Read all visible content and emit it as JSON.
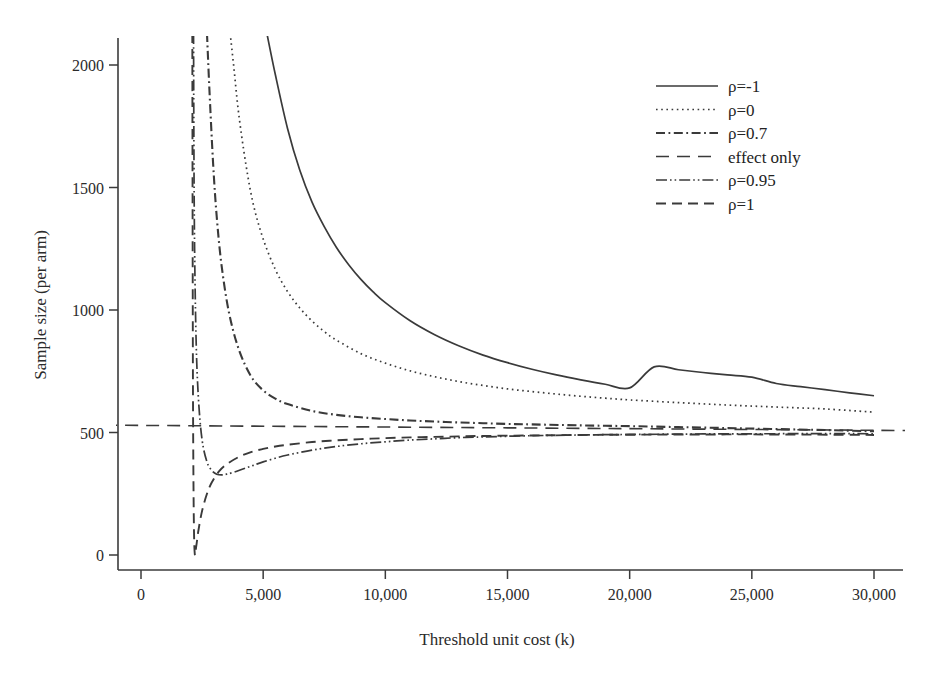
{
  "chart_data": {
    "type": "line",
    "title": "",
    "xlabel": "Threshold unit cost (k)",
    "ylabel": "Sample size (per arm)",
    "xlim": [
      -1500,
      31500
    ],
    "ylim": [
      -130,
      2130
    ],
    "xticks": [
      0,
      5000,
      10000,
      15000,
      20000,
      25000,
      30000
    ],
    "xticklabels": [
      "0",
      "5,000",
      "10,000",
      "15,000",
      "20,000",
      "25,000",
      "30,000"
    ],
    "yticks": [
      0,
      500,
      1000,
      1500,
      2000
    ],
    "yticklabels": [
      "0",
      "500",
      "1000",
      "1500",
      "2000"
    ],
    "grid": false,
    "legend_position": "upper right",
    "line_color": "#3a3a3a",
    "series": [
      {
        "name": "ρ=−1",
        "legend_label": "ρ=-1",
        "dash": "solid",
        "width": 1.7,
        "x": [
          5150,
          5500,
          6000,
          6500,
          7000,
          7500,
          8000,
          8500,
          9000,
          9500,
          10000,
          11000,
          12000,
          13000,
          14000,
          15000,
          16000,
          17000,
          18000,
          19000,
          20000,
          21000,
          22000,
          23000,
          24000,
          25000,
          26000,
          27000,
          28000,
          29000,
          30000
        ],
        "y": [
          2130,
          1960,
          1740,
          1570,
          1440,
          1340,
          1255,
          1185,
          1125,
          1074,
          1030,
          957,
          900,
          854,
          816,
          785,
          758,
          735,
          715,
          697,
          682,
          768,
          756,
          745,
          735,
          726,
          700,
          687,
          675,
          662,
          650
        ]
      },
      {
        "name": "ρ=0",
        "legend_label": "ρ=0",
        "dash": "dotted",
        "width": 1.7,
        "x": [
          3650,
          3800,
          4000,
          4300,
          4600,
          5000,
          5500,
          6000,
          6500,
          7000,
          7500,
          8000,
          9000,
          10000,
          11000,
          12000,
          13000,
          14000,
          15000,
          16000,
          17000,
          18000,
          19000,
          20000,
          22000,
          24000,
          26000,
          28000,
          30000
        ],
        "y": [
          2130,
          1990,
          1800,
          1590,
          1430,
          1290,
          1165,
          1075,
          1008,
          955,
          912,
          877,
          822,
          783,
          752,
          728,
          708,
          692,
          678,
          667,
          657,
          648,
          640,
          633,
          622,
          612,
          604,
          596,
          583
        ]
      },
      {
        "name": "ρ=0.7",
        "legend_label": "ρ=0.7",
        "dash": "dashdot",
        "width": 2.1,
        "x": [
          2700,
          2800,
          2950,
          3100,
          3300,
          3600,
          4000,
          4500,
          5000,
          5500,
          6000,
          7000,
          8000,
          9000,
          10000,
          11000,
          12000,
          13000,
          14000,
          15000,
          16000,
          18000,
          20000,
          22000,
          24000,
          26000,
          28000,
          30000
        ],
        "y": [
          2130,
          1900,
          1600,
          1380,
          1180,
          990,
          840,
          730,
          672,
          638,
          616,
          588,
          572,
          562,
          555,
          549,
          545,
          541,
          538,
          535,
          533,
          529,
          526,
          522,
          518,
          514,
          510,
          505
        ]
      },
      {
        "name": "effect only",
        "legend_label": "effect only",
        "dash": "dashed-long",
        "width": 1.6,
        "x": [
          -1500,
          31500
        ],
        "y": [
          530,
          508
        ]
      },
      {
        "name": "ρ=0.95",
        "legend_label": "ρ=0.95",
        "dash": "dashdotdot",
        "width": 1.7,
        "x": [
          2150,
          2180,
          2250,
          2350,
          2500,
          2700,
          2900,
          3100,
          3300,
          3500,
          3800,
          4200,
          4600,
          5000,
          5500,
          6000,
          7000,
          8000,
          9000,
          10000,
          11000,
          12000,
          13000,
          14000,
          16000,
          18000,
          20000,
          23000,
          26000,
          30000
        ],
        "y": [
          2130,
          1400,
          900,
          640,
          470,
          380,
          345,
          330,
          327,
          330,
          338,
          352,
          366,
          380,
          395,
          408,
          428,
          443,
          454,
          462,
          469,
          474,
          479,
          482,
          487,
          490,
          492,
          494,
          495,
          495
        ]
      },
      {
        "name": "ρ=1",
        "legend_label": "ρ=1",
        "dash": "dashed",
        "width": 1.9,
        "x": [
          2100,
          2115,
          2130,
          2160,
          2200,
          2260,
          2350,
          2500,
          2700,
          2900,
          3200,
          3500,
          4000,
          4500,
          5000,
          5500,
          6000,
          7000,
          8000,
          9000,
          10000,
          11000,
          12000,
          13000,
          14000,
          16000,
          18000,
          20000,
          23000,
          26000,
          30000
        ],
        "y": [
          2130,
          1200,
          600,
          160,
          5,
          35,
          100,
          180,
          250,
          297,
          342,
          370,
          400,
          420,
          433,
          443,
          450,
          461,
          468,
          473,
          477,
          480,
          482,
          484,
          486,
          488,
          490,
          491,
          492,
          492,
          490
        ]
      }
    ]
  },
  "legend": {
    "items": [
      {
        "label": "ρ=-1"
      },
      {
        "label": "ρ=0"
      },
      {
        "label": "ρ=0.7"
      },
      {
        "label": "effect only"
      },
      {
        "label": "ρ=0.95"
      },
      {
        "label": "ρ=1"
      }
    ]
  }
}
